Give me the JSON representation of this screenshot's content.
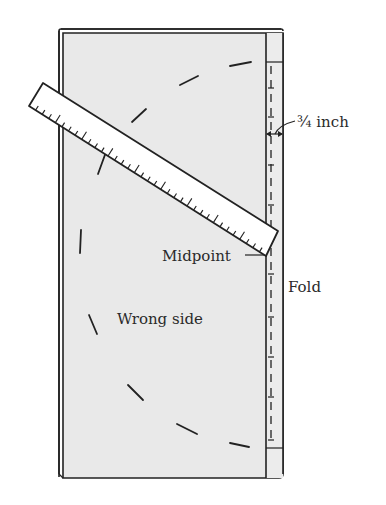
{
  "diagram": {
    "labels": {
      "measurement": "¾ inch",
      "midpoint": "Midpoint",
      "fold": "Fold",
      "fabric_side": "Wrong side"
    },
    "colors": {
      "fabric": "#e9e9e9",
      "ruler": "#ffffff",
      "line": "#222222"
    }
  }
}
